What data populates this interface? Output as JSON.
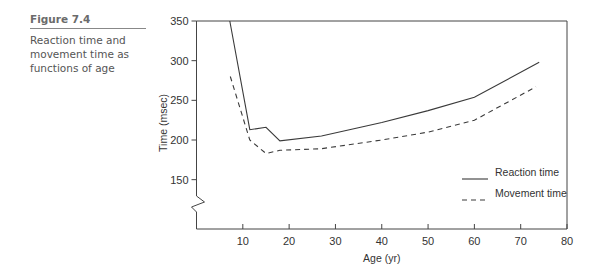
{
  "caption": {
    "figure_label": "Figure 7.4",
    "text": "Reaction time and movement time as functions of age"
  },
  "chart_data": {
    "type": "line",
    "title": "Reaction time and movement time as functions of age",
    "xlabel": "Age (yr)",
    "ylabel": "Time (msec)",
    "xlim": [
      0,
      80
    ],
    "ylim": [
      100,
      350
    ],
    "x_ticks": [
      10,
      20,
      30,
      40,
      50,
      60,
      70,
      80
    ],
    "y_ticks": [
      150,
      200,
      250,
      300,
      350
    ],
    "y_axis_break": true,
    "grid": false,
    "legend_position": "lower right",
    "series": [
      {
        "name": "Reaction time",
        "style": "solid",
        "points": [
          [
            7.2,
            350
          ],
          [
            11.5,
            213
          ],
          [
            15,
            216
          ],
          [
            18,
            199
          ],
          [
            27,
            205
          ],
          [
            40,
            222
          ],
          [
            50,
            237
          ],
          [
            60,
            254
          ],
          [
            74,
            298
          ]
        ]
      },
      {
        "name": "Movement time",
        "style": "dashed",
        "points": [
          [
            7.3,
            280
          ],
          [
            11.5,
            200
          ],
          [
            15,
            183
          ],
          [
            18,
            187
          ],
          [
            27,
            189
          ],
          [
            40,
            200
          ],
          [
            50,
            210
          ],
          [
            60,
            225
          ],
          [
            73.3,
            267
          ]
        ]
      }
    ]
  }
}
